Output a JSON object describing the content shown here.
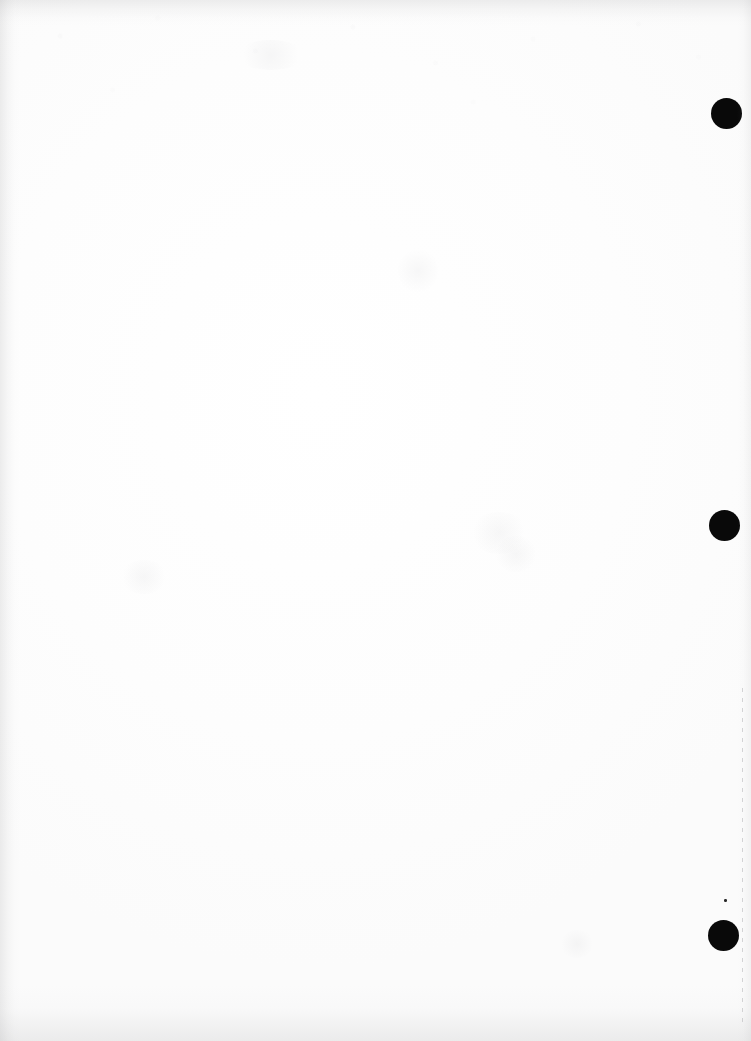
{
  "page": {
    "kind": "scanned-blank-page",
    "width": 751,
    "height": 1041,
    "background_color": "#ffffff",
    "paper_tone_color": "#fdfdfd",
    "body_text": ""
  },
  "marks": {
    "ink_color": "#090909",
    "speck_color": "#2a2a2a",
    "rule_color": "#78787d",
    "punch_dots": [
      {
        "label": "top-punch-dot",
        "x": 711,
        "y": 98,
        "size": 31
      },
      {
        "label": "middle-punch-dot",
        "x": 709,
        "y": 510,
        "size": 31
      },
      {
        "label": "bottom-punch-dot",
        "x": 708,
        "y": 920,
        "size": 31
      }
    ],
    "speck": {
      "label": "ink-speck",
      "x": 724,
      "y": 899,
      "size": 3
    },
    "margin_rule": {
      "label": "dashed-margin-rule",
      "x": 742,
      "y": 688,
      "height": 340
    }
  },
  "artifacts": {
    "edge_shadows": [
      "top",
      "left",
      "bottom",
      "right"
    ],
    "smudges": [
      {
        "x": 470,
        "y": 512,
        "w": 58,
        "h": 42
      },
      {
        "x": 494,
        "y": 536,
        "w": 44,
        "h": 36
      },
      {
        "x": 398,
        "y": 248,
        "w": 40,
        "h": 46
      },
      {
        "x": 120,
        "y": 560,
        "w": 48,
        "h": 34
      },
      {
        "x": 560,
        "y": 930,
        "w": 34,
        "h": 28
      },
      {
        "x": 236,
        "y": 40,
        "w": 70,
        "h": 30
      }
    ]
  }
}
